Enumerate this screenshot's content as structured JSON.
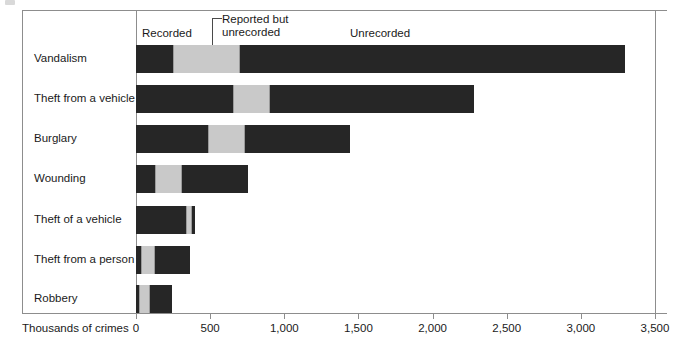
{
  "figure": {
    "axis_title": "Thousands of crimes"
  },
  "legend": {
    "recorded": "Recorded",
    "reported_but_unrecorded_line1": "Reported but",
    "reported_but_unrecorded_line2": "unrecorded",
    "unrecorded": "Unrecorded"
  },
  "axis": {
    "ticks": [
      "0",
      "500",
      "1,000",
      "1,500",
      "2,000",
      "2,500",
      "3,000",
      "3,500"
    ]
  },
  "chart_data": {
    "type": "bar",
    "orientation": "horizontal",
    "stacked": true,
    "title": "",
    "xlabel": "Thousands of crimes",
    "ylabel": "",
    "xlim": [
      0,
      3500
    ],
    "xticks": [
      0,
      500,
      1000,
      1500,
      2000,
      2500,
      3000,
      3500
    ],
    "xticklabels": [
      "0",
      "500",
      "1,000",
      "1,500",
      "2,000",
      "2,500",
      "3,000",
      "3,500"
    ],
    "grid": false,
    "legend_position": "top-inside",
    "categories": [
      "Vandalism",
      "Theft from a vehicle",
      "Burglary",
      "Wounding",
      "Theft of a vehicle",
      "Theft from a person",
      "Robbery"
    ],
    "series": [
      {
        "name": "Recorded",
        "color": "#262626",
        "values": [
          250,
          655,
          485,
          130,
          340,
          35,
          20
        ]
      },
      {
        "name": "Reported but unrecorded",
        "color": "#c9c9c9",
        "values": [
          450,
          250,
          250,
          180,
          35,
          95,
          75
        ]
      },
      {
        "name": "Unrecorded",
        "color": "#262626",
        "values": [
          2600,
          1375,
          705,
          445,
          25,
          235,
          150
        ]
      }
    ],
    "totals": [
      3300,
      2280,
      1440,
      755,
      400,
      365,
      245
    ]
  }
}
